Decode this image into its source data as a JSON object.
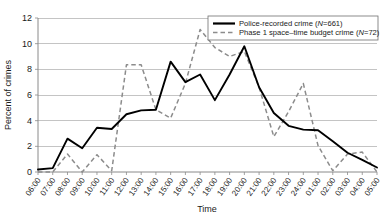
{
  "chart_data": {
    "type": "line",
    "title": "",
    "xlabel": "Time",
    "ylabel": "Percent of crimes",
    "ylim": [
      0,
      12
    ],
    "yticks": [
      0,
      2,
      4,
      6,
      8,
      10,
      12
    ],
    "grid": true,
    "legend_position": "top-right",
    "categories": [
      "06:00",
      "07:00",
      "08:00",
      "09:00",
      "10:00",
      "11:00",
      "12:00",
      "13:00",
      "14:00",
      "15:00",
      "16:00",
      "17:00",
      "18:00",
      "19:00",
      "20:00",
      "21:00",
      "22:00",
      "23:00",
      "24:00",
      "01:00",
      "02:00",
      "03:00",
      "04:00",
      "05:00"
    ],
    "series": [
      {
        "name": "Police-recorded crime (N=661)",
        "label_main": "Police-recorded crime (",
        "label_italic": "N",
        "label_tail": "=661)",
        "style": "solid",
        "color": "#000000",
        "n": 661,
        "values": [
          0.2,
          0.3,
          2.6,
          1.85,
          3.45,
          3.35,
          4.5,
          4.8,
          4.85,
          8.6,
          7.0,
          7.6,
          5.6,
          7.6,
          9.8,
          6.6,
          4.6,
          3.6,
          3.3,
          3.25,
          2.4,
          1.5,
          0.95,
          0.35
        ]
      },
      {
        "name": "Phase 1 space-time budget crime (N=72)",
        "label_main": "Phase 1 space–time budget crime (",
        "label_italic": "N",
        "label_tail": "=72)",
        "style": "dashed",
        "color": "#8c8c8c",
        "n": 72,
        "values": [
          0.0,
          0.0,
          1.4,
          0.0,
          1.35,
          0.1,
          8.35,
          8.35,
          4.85,
          4.2,
          6.9,
          11.1,
          9.7,
          9.0,
          9.4,
          6.6,
          2.75,
          4.7,
          6.9,
          2.05,
          0.1,
          1.4,
          1.55,
          0.0
        ]
      }
    ]
  },
  "axes": {
    "y_title": "Percent of crimes",
    "x_title": "Time"
  }
}
